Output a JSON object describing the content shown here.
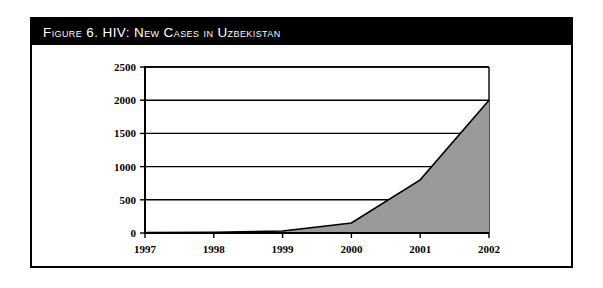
{
  "figure": {
    "title": "Figure 6.  HIV: New Cases in Uzbekistan",
    "frame_border_color": "#000000",
    "title_bar_color": "#000000",
    "title_text_color": "#ffffff",
    "background_color": "#ffffff"
  },
  "chart_data": {
    "type": "area",
    "title": "Figure 6.  HIV: New Cases in Uzbekistan",
    "xlabel": "",
    "ylabel": "",
    "categories": [
      "1997",
      "1998",
      "1999",
      "2000",
      "2001",
      "2002"
    ],
    "x": [
      1997,
      1998,
      1999,
      2000,
      2001,
      2002
    ],
    "values": [
      5,
      10,
      30,
      150,
      800,
      2000
    ],
    "series": [
      {
        "name": "New HIV cases",
        "values": [
          5,
          10,
          30,
          150,
          800,
          2000
        ]
      }
    ],
    "ylim": [
      0,
      2500
    ],
    "ytick_labels": [
      "0",
      "500",
      "1000",
      "1500",
      "2000",
      "2500"
    ],
    "yticks": [
      0,
      500,
      1000,
      1500,
      2000,
      2500
    ],
    "xtick_labels": [
      "1997",
      "1998",
      "1999",
      "2000",
      "2001",
      "2002"
    ],
    "grid": true,
    "grid_axis": "y",
    "legend": null,
    "area_fill_color": "#9a9a9a",
    "line_color": "#000000",
    "axis_color": "#000000",
    "plot_background_color": "#ffffff"
  }
}
